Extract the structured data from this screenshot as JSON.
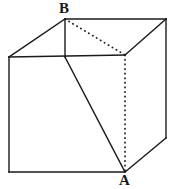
{
  "figure": {
    "width": 175,
    "height": 189,
    "background_color": "#ffffff",
    "stroke_color": "#1a1a1a"
  },
  "labels": {
    "vertex_a": "A",
    "vertex_b": "B"
  },
  "geometry": {
    "vertices": {
      "B_top_back_left": [
        65,
        19
      ],
      "top_back_right": [
        166,
        19
      ],
      "front_top_left": [
        9,
        57
      ],
      "front_top_right": [
        125,
        55
      ],
      "front_bottom_left": [
        9,
        172
      ],
      "A_front_bottom_right": [
        125,
        172
      ],
      "right_bottom_back": [
        166,
        138
      ],
      "front_top_mid": [
        65,
        57
      ]
    },
    "solid_edges": [
      [
        [
          65,
          19
        ],
        [
          166,
          19
        ]
      ],
      [
        [
          65,
          19
        ],
        [
          9,
          57
        ]
      ],
      [
        [
          166,
          19
        ],
        [
          125,
          55
        ]
      ],
      [
        [
          166,
          19
        ],
        [
          166,
          138
        ]
      ],
      [
        [
          166,
          138
        ],
        [
          125,
          172
        ]
      ],
      [
        [
          9,
          57
        ],
        [
          125,
          55
        ]
      ],
      [
        [
          9,
          57
        ],
        [
          9,
          172
        ]
      ],
      [
        [
          9,
          172
        ],
        [
          125,
          172
        ]
      ],
      [
        [
          125,
          55
        ],
        [
          125,
          172
        ]
      ],
      [
        [
          65,
          19
        ],
        [
          65,
          57
        ]
      ],
      [
        [
          65,
          57
        ],
        [
          125,
          172
        ]
      ]
    ],
    "dotted_edges": [
      [
        [
          65,
          19
        ],
        [
          125,
          55
        ]
      ],
      [
        [
          125,
          55
        ],
        [
          125,
          172
        ]
      ]
    ]
  }
}
